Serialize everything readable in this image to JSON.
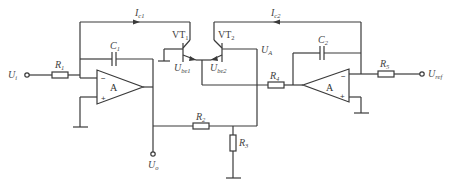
{
  "diagram": {
    "type": "circuit-schematic",
    "labels": {
      "input": {
        "main": "U",
        "sub": "i"
      },
      "output": {
        "main": "U",
        "sub": "o"
      },
      "reference": {
        "main": "U",
        "sub": "ref"
      },
      "ua": {
        "main": "U",
        "sub": "A"
      },
      "ic1": {
        "main": "I",
        "sub": "c1"
      },
      "ic2": {
        "main": "I",
        "sub": "c2"
      },
      "ube1": {
        "main": "U",
        "sub": "be1"
      },
      "ube2": {
        "main": "U",
        "sub": "be2"
      },
      "vt1": {
        "main": "VT",
        "sub": "1"
      },
      "vt2": {
        "main": "VT",
        "sub": "2"
      },
      "r1": {
        "main": "R",
        "sub": "1"
      },
      "r2": {
        "main": "R",
        "sub": "2"
      },
      "r3": {
        "main": "R",
        "sub": "3"
      },
      "r4": {
        "main": "R",
        "sub": "4"
      },
      "r5": {
        "main": "R",
        "sub": "5"
      },
      "c1": {
        "main": "C",
        "sub": "1"
      },
      "c2": {
        "main": "C",
        "sub": "2"
      },
      "opamp1": "A",
      "opamp2": "A",
      "minus": "−",
      "plus": "+"
    },
    "colors": {
      "line": "#3a3a3a",
      "text": "#444444",
      "background": "#ffffff"
    }
  }
}
